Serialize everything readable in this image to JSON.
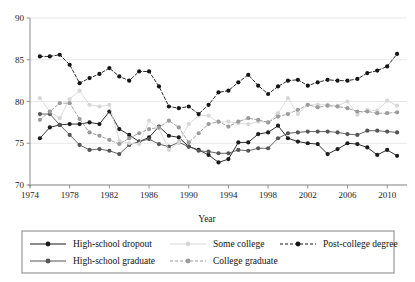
{
  "chart_data": {
    "type": "line",
    "title": "",
    "xlabel": "Year",
    "ylabel": "",
    "xlim": [
      1974,
      2012
    ],
    "ylim": [
      70,
      90
    ],
    "grid": true,
    "legend_position": "bottom",
    "xticks": [
      1974,
      1978,
      1982,
      1986,
      1990,
      1994,
      1998,
      2002,
      2006,
      2010
    ],
    "yticks": [
      70,
      75,
      80,
      85,
      90
    ],
    "x": [
      1975,
      1976,
      1977,
      1978,
      1979,
      1980,
      1981,
      1982,
      1983,
      1984,
      1985,
      1986,
      1987,
      1988,
      1989,
      1990,
      1991,
      1992,
      1993,
      1994,
      1995,
      1996,
      1997,
      1998,
      1999,
      2000,
      2001,
      2002,
      2003,
      2004,
      2005,
      2006,
      2007,
      2008,
      2009,
      2010,
      2011
    ],
    "series": [
      {
        "name": "High-school dropout",
        "color": "#1b1b1b",
        "dash": "none",
        "marker": "circle",
        "values": [
          75.6,
          76.9,
          77.2,
          77.3,
          77.3,
          77.5,
          77.3,
          78.8,
          76.7,
          76.0,
          75.2,
          75.7,
          77.0,
          75.9,
          75.7,
          74.6,
          74.2,
          73.6,
          72.7,
          73.1,
          75.1,
          75.1,
          76.1,
          76.3,
          77.1,
          75.6,
          75.2,
          75.0,
          74.9,
          73.7,
          74.3,
          75.0,
          74.9,
          74.5,
          73.6,
          74.2,
          73.5
        ]
      },
      {
        "name": "High-school graduate",
        "color": "#555555",
        "dash": "none",
        "marker": "circle",
        "values": [
          78.5,
          78.5,
          77.2,
          76.0,
          74.8,
          74.2,
          74.3,
          74.1,
          73.7,
          74.8,
          75.2,
          75.5,
          74.9,
          74.6,
          75.1,
          74.6,
          74.1,
          74.0,
          73.8,
          73.8,
          74.2,
          74.1,
          74.4,
          74.4,
          75.6,
          76.2,
          76.3,
          76.4,
          76.4,
          76.4,
          76.3,
          76.1,
          76.0,
          76.5,
          76.5,
          76.4,
          76.3
        ]
      },
      {
        "name": "Some college",
        "color": "#d7d7d7",
        "dash": "none",
        "marker": "circle",
        "values": [
          80.4,
          78.8,
          78.0,
          80.3,
          81.3,
          79.6,
          79.4,
          79.6,
          75.3,
          75.0,
          74.9,
          77.7,
          76.8,
          74.2,
          75.1,
          77.3,
          78.3,
          78.3,
          77.5,
          77.6,
          77.4,
          77.3,
          77.6,
          77.5,
          78.6,
          80.4,
          78.5,
          79.6,
          79.6,
          79.6,
          79.5,
          80.0,
          78.4,
          79.0,
          78.9,
          80.1,
          79.5
        ]
      },
      {
        "name": "College graduate",
        "color": "#9b9b9b",
        "dash": "dashed",
        "marker": "circle",
        "values": [
          77.8,
          78.8,
          79.8,
          79.8,
          77.9,
          76.3,
          75.9,
          75.4,
          74.9,
          75.6,
          76.2,
          76.7,
          76.9,
          77.7,
          76.9,
          75.1,
          76.2,
          77.3,
          77.6,
          77.0,
          77.6,
          78.0,
          77.8,
          77.5,
          78.2,
          78.5,
          79.0,
          79.6,
          79.3,
          79.5,
          79.4,
          79.2,
          78.8,
          78.8,
          78.6,
          78.6,
          78.7
        ]
      },
      {
        "name": "Post-college degree",
        "color": "#151515",
        "dash": "dashed",
        "marker": "circle",
        "values": [
          85.4,
          85.4,
          85.6,
          84.4,
          82.2,
          82.8,
          83.3,
          84.0,
          83.0,
          82.5,
          83.6,
          83.6,
          81.8,
          79.4,
          79.2,
          79.4,
          78.5,
          79.6,
          81.1,
          81.3,
          82.3,
          83.2,
          81.9,
          80.9,
          81.8,
          82.5,
          82.6,
          81.9,
          82.3,
          82.6,
          82.5,
          82.5,
          82.7,
          83.4,
          83.7,
          84.2,
          85.7
        ]
      }
    ]
  },
  "legend": {
    "entries": [
      {
        "label": "High-school dropout"
      },
      {
        "label": "High-school graduate"
      },
      {
        "label": "Some college"
      },
      {
        "label": "College graduate"
      },
      {
        "label": "Post-college degree"
      }
    ]
  }
}
